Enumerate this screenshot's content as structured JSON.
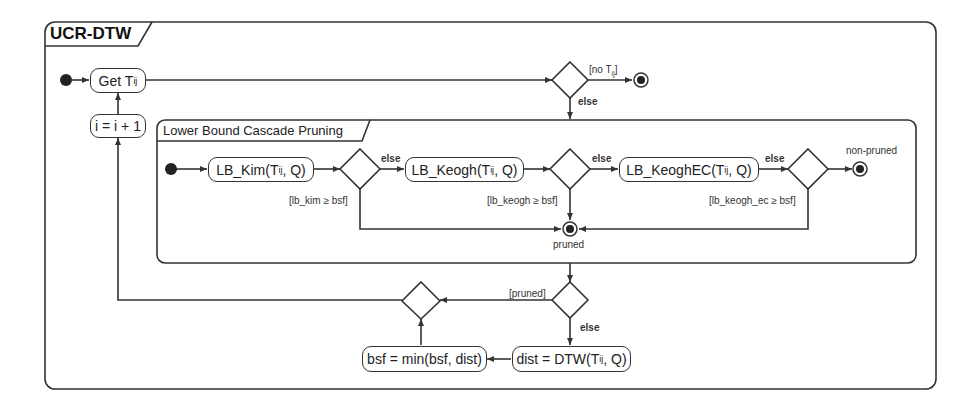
{
  "diagram": {
    "type": "UML activity diagram",
    "outer_frame": {
      "title": "UCR-DTW"
    },
    "inner_frame": {
      "title": "Lower Bound Cascade Pruning"
    },
    "actions": {
      "get_t": {
        "text": "Get T",
        "sub": "ij"
      },
      "increment": {
        "text": "i = i + 1"
      },
      "lb_kim": {
        "text": "LB_Kim(T",
        "sub": "ij",
        "tail": ", Q)"
      },
      "lb_keogh": {
        "text": "LB_Keogh(T",
        "sub": "ij",
        "tail": ", Q)"
      },
      "lb_keogh_ec": {
        "text": "LB_KeoghEC(T",
        "sub": "ij",
        "tail": ", Q)"
      },
      "dtw": {
        "text": "dist = DTW(T",
        "sub": "ij",
        "tail": ", Q)"
      },
      "bsf": {
        "text": "bsf = min(bsf, dist)"
      }
    },
    "guards": {
      "no_t": {
        "text": "[no T",
        "sub": "ij",
        "tail": "]"
      },
      "else_top": "else",
      "lb_kim_guard": "[lb_kim ≥ bsf]",
      "else_kim": "else",
      "lb_keogh_guard": "[lb_keogh ≥ bsf]",
      "else_keogh": "else",
      "lb_keogh_ec_guard": "[lb_keogh_ec ≥ bsf]",
      "else_keogh_ec": "else",
      "pruned_guard": "[pruned]",
      "else_bottom": "else"
    },
    "final_labels": {
      "non_pruned": "non-pruned",
      "pruned": "pruned"
    }
  }
}
